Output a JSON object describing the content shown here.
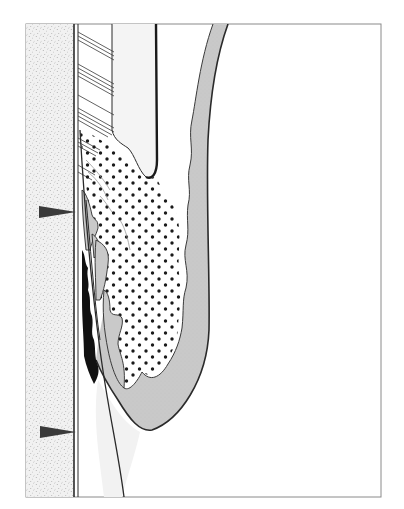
{
  "figure": {
    "type": "schematic cross-section line drawing",
    "labels": [],
    "frame": {
      "x": 26,
      "y": 24,
      "width": 355,
      "height": 473,
      "stroke": "#8a8a8a"
    },
    "colors": {
      "stippled_band": "#f1f1f1",
      "stipple_dot": "#6e6e6e",
      "grey_fill": "#c9c9c9",
      "light_grey_fill": "#ededed",
      "very_light_fill": "#f4f4f4",
      "outline": "#2a2a2a",
      "black_deposit": "#111111",
      "arrowhead": "#3a3a3a",
      "dot": "#1a1a1a"
    },
    "arrowheads": [
      {
        "name": "upper-arrowhead",
        "tip_x": 76,
        "y": 212
      },
      {
        "name": "lower-arrowhead",
        "tip_x": 76,
        "y": 432
      }
    ]
  }
}
